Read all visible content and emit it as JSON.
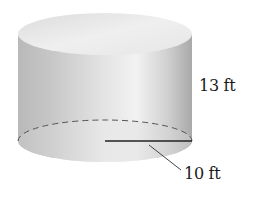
{
  "figure": {
    "shape": "cylinder",
    "height_label": "13 ft",
    "radius_label": "10 ft",
    "colors": {
      "background": "#ffffff",
      "body_dark": "#ababab",
      "body_light": "#f2f2f2",
      "top_face": "#ececec",
      "line": "#222222",
      "dashed_line": "#555555",
      "text": "#1a1a1a"
    }
  }
}
